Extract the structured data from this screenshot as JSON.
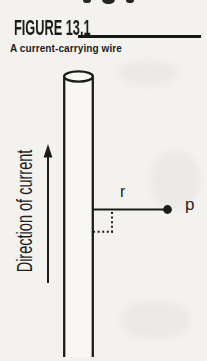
{
  "figure": {
    "label": "FIGURE 13.1",
    "caption": "A current-carrying wire"
  },
  "diagram": {
    "direction_label": "Direction of current",
    "distance_label": "r",
    "point_label": "p"
  },
  "colors": {
    "ink": "#1c1c1c",
    "background": "#f3f2ef",
    "wire_fill": "#f8f7f4"
  }
}
